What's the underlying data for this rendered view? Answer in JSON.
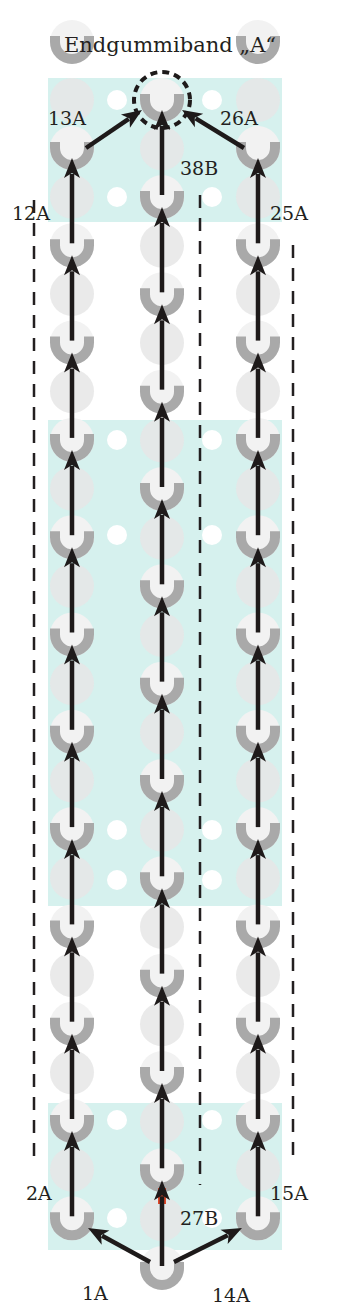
{
  "title": "Endgummiband „A“",
  "colors": {
    "band": "#d6f1ee",
    "peg_ring": "#a9a9a9",
    "peg_light": "#e6e6e6",
    "peg_center": "#f2f2f2",
    "hole": "#ffffff",
    "arrow": "#1e1a1a",
    "highlight": "#e0482a",
    "dash": "#231f20"
  },
  "bands": [
    {
      "x": 48,
      "y": 78,
      "w": 234,
      "h": 144
    },
    {
      "x": 48,
      "y": 420,
      "w": 234,
      "h": 486
    },
    {
      "x": 48,
      "y": 1103,
      "w": 234,
      "h": 147
    }
  ],
  "columns": {
    "left_x": 72,
    "middle_x": 162,
    "right_x": 258,
    "hole_left_x": 117,
    "hole_right_x": 212
  },
  "labels": [
    {
      "id": "1A",
      "text": "1A",
      "x": 82,
      "y": 1300
    },
    {
      "id": "2A",
      "text": "2A",
      "x": 26,
      "y": 1200
    },
    {
      "id": "12A",
      "text": "12A",
      "x": 12,
      "y": 220
    },
    {
      "id": "13A",
      "text": "13A",
      "x": 48,
      "y": 125
    },
    {
      "id": "14A",
      "text": "14A",
      "x": 212,
      "y": 1302
    },
    {
      "id": "15A",
      "text": "15A",
      "x": 270,
      "y": 1200
    },
    {
      "id": "25A",
      "text": "25A",
      "x": 270,
      "y": 220
    },
    {
      "id": "26A",
      "text": "26A",
      "x": 220,
      "y": 125
    },
    {
      "id": "27B",
      "text": "27B",
      "x": 180,
      "y": 1225
    },
    {
      "id": "38B",
      "text": "38B",
      "x": 180,
      "y": 175
    }
  ],
  "dashed_lines": [
    {
      "x": 34,
      "y1": 200,
      "y2": 1165
    },
    {
      "x": 200,
      "y1": 195,
      "y2": 1185
    },
    {
      "x": 293,
      "y1": 245,
      "y2": 1165
    }
  ]
}
